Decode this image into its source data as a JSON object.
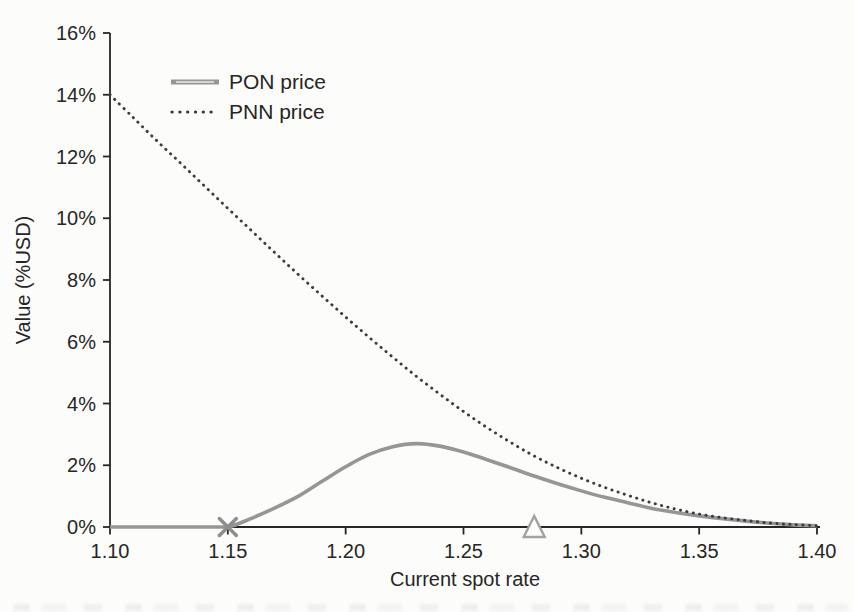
{
  "chart_data": {
    "type": "line",
    "title": "",
    "xlabel": "Current spot rate",
    "ylabel": "Value (%USD)",
    "xlim": [
      1.1,
      1.4
    ],
    "ylim": [
      0,
      16
    ],
    "grid": false,
    "legend_position": "top-left-inside",
    "x_ticks": [
      1.1,
      1.15,
      1.2,
      1.25,
      1.3,
      1.35,
      1.4
    ],
    "x_tick_labels": [
      "1.10",
      "1.15",
      "1.20",
      "1.25",
      "1.30",
      "1.35",
      "1.40"
    ],
    "y_ticks": [
      0,
      2,
      4,
      6,
      8,
      10,
      12,
      14,
      16
    ],
    "y_tick_labels": [
      "0%",
      "2%",
      "4%",
      "6%",
      "8%",
      "10%",
      "12%",
      "14%",
      "16%"
    ],
    "axis_color": "#262626",
    "legend": [
      {
        "label": "PON price",
        "style": "solid",
        "color": "#969696"
      },
      {
        "label": "PNN price",
        "style": "dotted",
        "color": "#3c3c3c"
      }
    ],
    "series": [
      {
        "name": "PON price",
        "style": "solid",
        "color": "#969696",
        "x": [
          1.1,
          1.11,
          1.12,
          1.13,
          1.14,
          1.15,
          1.16,
          1.17,
          1.18,
          1.19,
          1.2,
          1.21,
          1.22,
          1.23,
          1.24,
          1.25,
          1.26,
          1.27,
          1.28,
          1.29,
          1.3,
          1.31,
          1.32,
          1.33,
          1.34,
          1.35,
          1.36,
          1.37,
          1.38,
          1.39,
          1.4
        ],
        "y": [
          0,
          0,
          0,
          0,
          0,
          0,
          0.28,
          0.62,
          1.0,
          1.48,
          1.95,
          2.35,
          2.6,
          2.7,
          2.62,
          2.43,
          2.18,
          1.92,
          1.65,
          1.4,
          1.17,
          0.96,
          0.78,
          0.6,
          0.47,
          0.36,
          0.27,
          0.19,
          0.12,
          0.07,
          0.04
        ]
      },
      {
        "name": "PNN price",
        "style": "dotted",
        "color": "#3c3c3c",
        "x": [
          1.1,
          1.11,
          1.12,
          1.13,
          1.14,
          1.15,
          1.16,
          1.17,
          1.18,
          1.19,
          1.2,
          1.21,
          1.22,
          1.23,
          1.24,
          1.25,
          1.26,
          1.27,
          1.28,
          1.29,
          1.3,
          1.31,
          1.32,
          1.33,
          1.34,
          1.35,
          1.36,
          1.37,
          1.38,
          1.39,
          1.4
        ],
        "y": [
          14.0,
          13.25,
          12.5,
          11.78,
          11.05,
          10.32,
          9.6,
          8.88,
          8.17,
          7.48,
          6.8,
          6.14,
          5.5,
          4.88,
          4.3,
          3.74,
          3.22,
          2.74,
          2.3,
          1.92,
          1.58,
          1.28,
          1.02,
          0.78,
          0.58,
          0.42,
          0.3,
          0.21,
          0.13,
          0.08,
          0.04
        ]
      }
    ],
    "markers": [
      {
        "name": "barrier-x-marker",
        "shape": "x",
        "x": 1.15,
        "y": 0,
        "color": "#8d8d8d",
        "size": 17
      },
      {
        "name": "strike-triangle-marker",
        "shape": "triangle-up-open",
        "x": 1.28,
        "y": 0,
        "color": "#a2a2a2",
        "size": 21
      }
    ]
  }
}
